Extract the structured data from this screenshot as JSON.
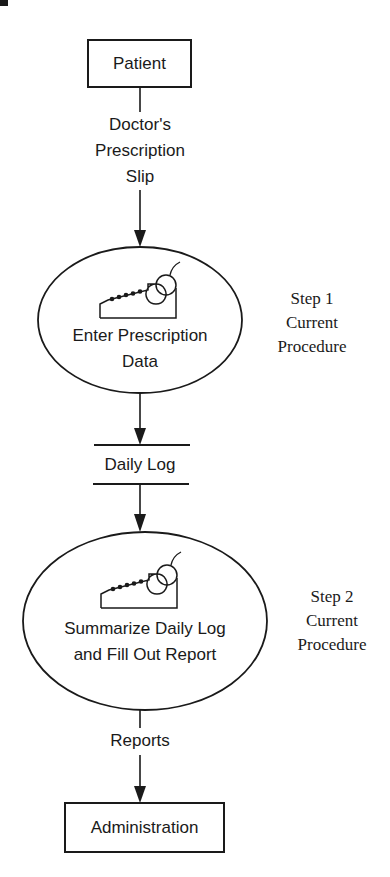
{
  "diagram": {
    "type": "data-flow-diagram",
    "entities": {
      "source": {
        "label": "Patient"
      },
      "sink": {
        "label": "Administration"
      }
    },
    "flows": {
      "prescription_slip": {
        "line1": "Doctor's",
        "line2": "Prescription",
        "line3": "Slip"
      },
      "reports": {
        "label": "Reports"
      }
    },
    "processes": [
      {
        "line1": "Enter Prescription",
        "line2": "Data",
        "icon": "cash-register-icon",
        "step": {
          "line1": "Step 1",
          "line2": "Current",
          "line3": "Procedure"
        }
      },
      {
        "line1": "Summarize Daily Log",
        "line2": "and Fill Out Report",
        "icon": "cash-register-icon",
        "step": {
          "line1": "Step 2",
          "line2": "Current",
          "line3": "Procedure"
        }
      }
    ],
    "data_store": {
      "label": "Daily Log"
    },
    "colors": {
      "ink": "#1a1a1a",
      "background": "#ffffff"
    }
  }
}
